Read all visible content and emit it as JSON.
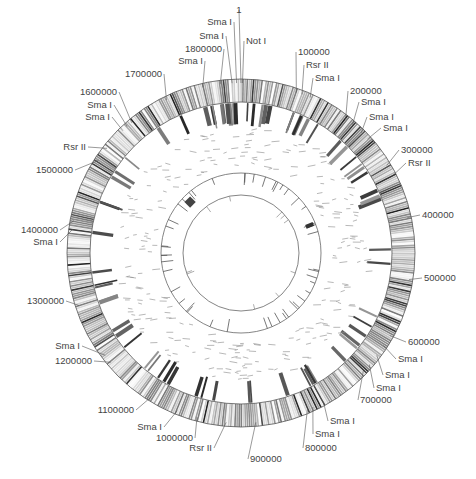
{
  "figure": {
    "type": "circular-genome-map",
    "center": [
      241,
      253
    ],
    "rings": {
      "outer_band": {
        "r_outer": 174,
        "r_inner": 151
      },
      "ticks_ring": {
        "r_outer": 150,
        "r_inner": 132
      },
      "middle_circle": {
        "r": 80
      },
      "inner_circle": {
        "r": 58
      }
    },
    "labels": [
      {
        "text": "1",
        "angle": 0,
        "tx": 239,
        "ty": 13,
        "anchor": "middle"
      },
      {
        "text": "Sma I",
        "angle": -1.5,
        "tx": 232,
        "ty": 25,
        "anchor": "end"
      },
      {
        "text": "Sma I",
        "angle": -3,
        "tx": 224,
        "ty": 39,
        "anchor": "end"
      },
      {
        "text": "Not I",
        "angle": 0.5,
        "tx": 246,
        "ty": 44,
        "anchor": "start"
      },
      {
        "text": "1800000",
        "angle": -7,
        "tx": 222,
        "ty": 52,
        "anchor": "end"
      },
      {
        "text": "Sma I",
        "angle": -13,
        "tx": 203,
        "ty": 64,
        "anchor": "end"
      },
      {
        "text": "1700000",
        "angle": -26,
        "tx": 162,
        "ty": 77,
        "anchor": "end"
      },
      {
        "text": "100000",
        "angle": 19,
        "tx": 298,
        "ty": 55,
        "anchor": "start"
      },
      {
        "text": "Rsr II",
        "angle": 21,
        "tx": 306,
        "ty": 68,
        "anchor": "start"
      },
      {
        "text": "Sma I",
        "angle": 24,
        "tx": 315,
        "ty": 81,
        "anchor": "start"
      },
      {
        "text": "200000",
        "angle": 38,
        "tx": 350,
        "ty": 94,
        "anchor": "start"
      },
      {
        "text": "Sma I",
        "angle": 41,
        "tx": 361,
        "ty": 105,
        "anchor": "start"
      },
      {
        "text": "Sma I",
        "angle": 45,
        "tx": 369,
        "ty": 120,
        "anchor": "start"
      },
      {
        "text": "Sma I",
        "angle": 48,
        "tx": 383,
        "ty": 131,
        "anchor": "start"
      },
      {
        "text": "300000",
        "angle": 59,
        "tx": 401,
        "ty": 153,
        "anchor": "start"
      },
      {
        "text": "Rsr II",
        "angle": 63,
        "tx": 408,
        "ty": 166,
        "anchor": "start"
      },
      {
        "text": "400000",
        "angle": 78,
        "tx": 422,
        "ty": 218,
        "anchor": "start"
      },
      {
        "text": "500000",
        "angle": 99,
        "tx": 424,
        "ty": 281,
        "anchor": "start"
      },
      {
        "text": "600000",
        "angle": 119,
        "tx": 408,
        "ty": 345,
        "anchor": "start"
      },
      {
        "text": "Sma I",
        "angle": 123,
        "tx": 398,
        "ty": 362,
        "anchor": "start"
      },
      {
        "text": "Sma I",
        "angle": 127,
        "tx": 385,
        "ty": 378,
        "anchor": "start"
      },
      {
        "text": "Sma I",
        "angle": 131,
        "tx": 376,
        "ty": 391,
        "anchor": "start"
      },
      {
        "text": "700000",
        "angle": 134,
        "tx": 360,
        "ty": 403,
        "anchor": "start"
      },
      {
        "text": "Sma I",
        "angle": 151,
        "tx": 330,
        "ty": 424,
        "anchor": "start"
      },
      {
        "text": "Sma I",
        "angle": 155,
        "tx": 315,
        "ty": 437,
        "anchor": "start"
      },
      {
        "text": "800000",
        "angle": 157,
        "tx": 305,
        "ty": 451,
        "anchor": "start"
      },
      {
        "text": "900000",
        "angle": 175,
        "tx": 250,
        "ty": 462,
        "anchor": "start"
      },
      {
        "text": "Rsr II",
        "angle": -175,
        "tx": 212,
        "ty": 451,
        "anchor": "end"
      },
      {
        "text": "1000000",
        "angle": -165,
        "tx": 193,
        "ty": 441,
        "anchor": "end"
      },
      {
        "text": "Sma I",
        "angle": -158,
        "tx": 162,
        "ty": 430,
        "anchor": "end"
      },
      {
        "text": "1100000",
        "angle": -148,
        "tx": 134,
        "ty": 413,
        "anchor": "end"
      },
      {
        "text": "1200000",
        "angle": -130,
        "tx": 92,
        "ty": 364,
        "anchor": "end"
      },
      {
        "text": "Sma I",
        "angle": -127,
        "tx": 80,
        "ty": 349,
        "anchor": "end"
      },
      {
        "text": "1300000",
        "angle": -108,
        "tx": 64,
        "ty": 304,
        "anchor": "end"
      },
      {
        "text": "Sma I",
        "angle": -82,
        "tx": 58,
        "ty": 245,
        "anchor": "end"
      },
      {
        "text": "1400000",
        "angle": -79,
        "tx": 58,
        "ty": 233,
        "anchor": "end"
      },
      {
        "text": "1500000",
        "angle": -57,
        "tx": 73,
        "ty": 173,
        "anchor": "end"
      },
      {
        "text": "Rsr II",
        "angle": -52,
        "tx": 86,
        "ty": 150,
        "anchor": "end"
      },
      {
        "text": "Sma I",
        "angle": -44,
        "tx": 110,
        "ty": 120,
        "anchor": "end"
      },
      {
        "text": "Sma I",
        "angle": -42,
        "tx": 112,
        "ty": 108,
        "anchor": "end"
      },
      {
        "text": "1600000",
        "angle": -40,
        "tx": 117,
        "ty": 95,
        "anchor": "end"
      }
    ]
  }
}
